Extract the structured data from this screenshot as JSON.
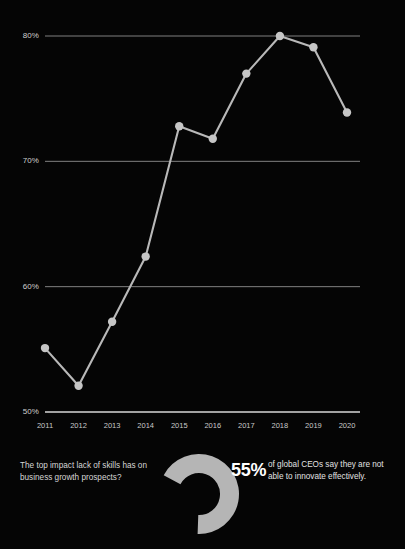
{
  "chart_data": {
    "type": "line",
    "title": "",
    "subtitle": "",
    "xlabel": "",
    "ylabel": "",
    "categories": [
      "2011",
      "2012",
      "2013",
      "2014",
      "2015",
      "2016",
      "2017",
      "2018",
      "2019",
      "2020"
    ],
    "values": [
      55.1,
      52.1,
      57.2,
      62.4,
      72.8,
      71.8,
      77.0,
      80.0,
      79.1,
      73.9
    ],
    "series": [
      {
        "name": "CEOs concerned about availability of key skills",
        "values": [
          55.1,
          52.1,
          57.2,
          62.4,
          72.8,
          71.8,
          77.0,
          80.0,
          79.1,
          73.9
        ]
      }
    ],
    "ylim": [
      50,
      80
    ],
    "yticks": [
      50,
      60,
      70,
      80
    ],
    "ytick_labels": [
      "50%",
      "60%",
      "70%",
      "80%"
    ],
    "xtick_labels": [
      "2011",
      "2012",
      "2013",
      "2014",
      "2015",
      "2016",
      "2017",
      "2018",
      "2019",
      "2020"
    ],
    "grid": true,
    "legend": "none",
    "line_color": "#b9b9b9",
    "marker_color": "#c6c6c6",
    "axis_color": "#d7d7d7",
    "grid_color": "#8e8e8e",
    "background": "#050505"
  },
  "stat": {
    "question": "The top impact lack of skills has on business growth prospects?",
    "percent": "55%",
    "percent_value": 55,
    "description": "of global CEOs say they are not able to innovate effectively.",
    "donut_color": "#b5b5b5",
    "donut_track_color": "#050505"
  },
  "icons": {
    "donut": "donut-chart-icon"
  }
}
